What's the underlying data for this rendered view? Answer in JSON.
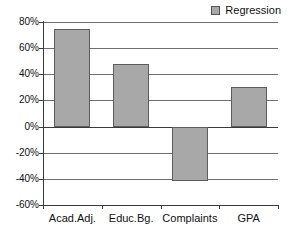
{
  "chart_data": {
    "type": "bar",
    "title": "",
    "xlabel": "",
    "ylabel": "",
    "categories": [
      "Acad.Adj.",
      "Educ.Bg.",
      "Complaints",
      "GPA"
    ],
    "values": [
      75,
      48,
      -42,
      30
    ],
    "value_labels": [
      "75%",
      "48%",
      "-42%",
      "30%"
    ],
    "series": [
      {
        "name": "Regression",
        "values": [
          75,
          48,
          -42,
          30
        ],
        "color": "#a8a8a8",
        "border_color": "#5d5d5d"
      }
    ],
    "ylim": [
      -60,
      80
    ],
    "ytick_values": [
      80,
      60,
      40,
      20,
      0,
      -20,
      -40,
      -60
    ],
    "ytick_labels": [
      "80%",
      "60%",
      "40%",
      "20%",
      "0%",
      "-20%",
      "-40%",
      "-60%"
    ],
    "grid": true,
    "grid_color": "#6e6e6e",
    "zero_line_color": "#3a3a3a",
    "axis_color": "#3a3a3a",
    "background": "#ffffff",
    "legend": {
      "position": "top-right",
      "entries": [
        {
          "label": "Regression",
          "color": "#a8a8a8"
        }
      ]
    }
  }
}
